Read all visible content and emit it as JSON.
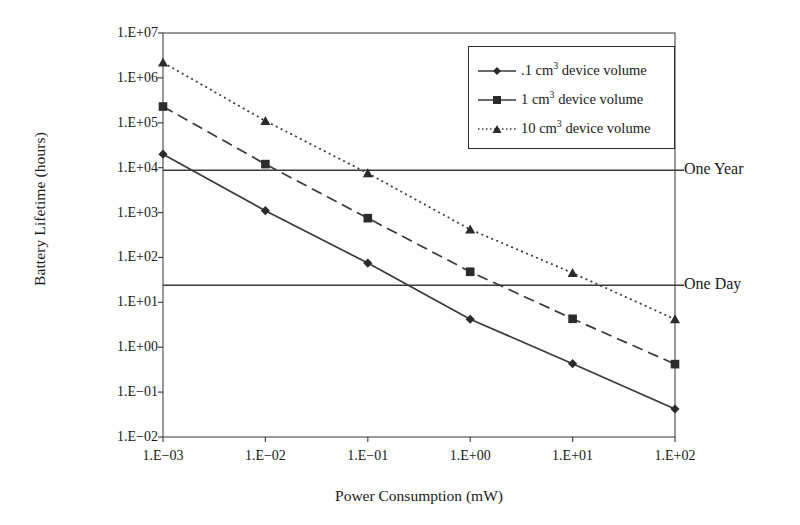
{
  "chart_data": {
    "type": "line",
    "title": "",
    "xlabel": "Power Consumption (mW)",
    "ylabel": "Battery Lifetime (hours)",
    "xscale": "log",
    "yscale": "log",
    "xlim": [
      0.001,
      100
    ],
    "ylim": [
      0.01,
      10000000
    ],
    "grid": false,
    "legend_position": "top-right",
    "x": [
      0.001,
      0.01,
      0.1,
      1,
      10,
      100
    ],
    "xtick_labels": [
      "1.E−03",
      "1.E−02",
      "1.E−01",
      "1.E+00",
      "1.E+01",
      "1.E+02"
    ],
    "ytick_labels": [
      "1.E+07",
      "1.E+06",
      "1.E+05",
      "1.E+04",
      "1.E+03",
      "1.E+02",
      "1.E+01",
      "1.E+00",
      "1.E−01",
      "1.E−02"
    ],
    "ytick_values": [
      10000000,
      1000000,
      100000,
      10000,
      1000,
      100,
      10,
      1,
      0.1,
      0.01
    ],
    "series": [
      {
        "name": ".1 cm3 device volume",
        "label_prefix": ".1 cm",
        "label_sup": "3",
        "label_suffix": " device volume",
        "marker": "diamond",
        "linestyle": "solid",
        "color": "#3a3a3a",
        "values": [
          20000,
          1100,
          75,
          4.2,
          0.43,
          0.042
        ]
      },
      {
        "name": "1 cm3 device volume",
        "label_prefix": "1 cm",
        "label_sup": "3",
        "label_suffix": " device volume",
        "marker": "square",
        "linestyle": "dashed",
        "color": "#3a3a3a",
        "values": [
          230000,
          12000,
          750,
          48,
          4.3,
          0.42
        ]
      },
      {
        "name": "10 cm3 device volume",
        "label_prefix": "10 cm",
        "label_sup": "3",
        "label_suffix": " device volume",
        "marker": "triangle",
        "linestyle": "dotted",
        "color": "#3a3a3a",
        "values": [
          2200000,
          110000,
          7500,
          420,
          45,
          4.2
        ]
      }
    ],
    "reference_lines": [
      {
        "label": "One Year",
        "value": 8760
      },
      {
        "label": "One Day",
        "value": 24
      }
    ]
  }
}
